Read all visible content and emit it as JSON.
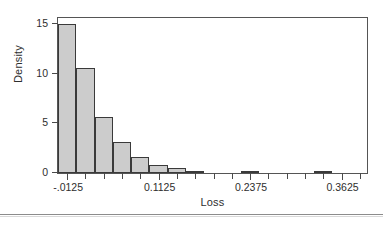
{
  "chart_data": {
    "type": "bar",
    "title": "",
    "xlabel": "Loss",
    "ylabel": "Density",
    "xlim": [
      -0.025,
      0.4
    ],
    "ylim": [
      0,
      15.8
    ],
    "grid": false,
    "legend": null,
    "bin_width": 0.025,
    "bin_starts": [
      -0.025,
      0.0,
      0.025,
      0.05,
      0.075,
      0.1,
      0.125,
      0.15,
      0.175,
      0.2,
      0.225,
      0.25,
      0.275,
      0.3,
      0.325,
      0.35,
      0.375
    ],
    "values": [
      15.0,
      10.6,
      5.6,
      3.1,
      1.65,
      0.85,
      0.55,
      0.25,
      0.0,
      0.0,
      0.1,
      0.0,
      0.0,
      0.0,
      0.05,
      0.0,
      0.0
    ],
    "y_ticks": [
      0,
      5,
      10,
      15
    ],
    "y_tick_labels": [
      "0",
      "5",
      "10",
      "15"
    ],
    "x_ticks": [
      -0.0125,
      0.0125,
      0.0375,
      0.0625,
      0.0875,
      0.1125,
      0.1375,
      0.1625,
      0.1875,
      0.2125,
      0.2375,
      0.2625,
      0.2875,
      0.3125,
      0.3375,
      0.3625,
      0.3875
    ],
    "x_tick_labels": [
      "-.0125",
      "",
      "",
      "",
      "",
      "0.1125",
      "",
      "",
      "",
      "",
      "0.2375",
      "",
      "",
      "",
      "",
      "0.3625",
      ""
    ],
    "bar_fill_color": "#cccccc",
    "bar_edge_color": "#3a3a3a",
    "frame_color": "#555555"
  }
}
